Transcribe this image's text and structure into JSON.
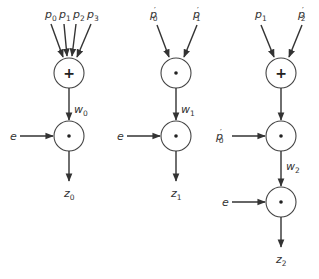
{
  "diagram": {
    "colors": {
      "stroke": "#333333",
      "background": "#ffffff"
    },
    "networks": [
      {
        "id": "net0",
        "inputs": [
          {
            "base": "p",
            "sub": "0",
            "prime": ""
          },
          {
            "base": "p",
            "sub": "1",
            "prime": ""
          },
          {
            "base": "p",
            "sub": "2",
            "prime": ""
          },
          {
            "base": "p",
            "sub": "3",
            "prime": ""
          }
        ],
        "nodes": [
          {
            "op": "+",
            "op_name": "sum"
          },
          {
            "op": "•",
            "op_name": "product",
            "side_input": {
              "base": "e",
              "sub": "",
              "prime": ""
            }
          }
        ],
        "intermediate": {
          "base": "w",
          "sub": "0"
        },
        "output": {
          "base": "z",
          "sub": "0"
        }
      },
      {
        "id": "net1",
        "inputs": [
          {
            "base": "p",
            "sub": "0",
            "prime": "′"
          },
          {
            "base": "p",
            "sub": "1",
            "prime": "′"
          }
        ],
        "nodes": [
          {
            "op": "•",
            "op_name": "product"
          },
          {
            "op": "•",
            "op_name": "product",
            "side_input": {
              "base": "e",
              "sub": "",
              "prime": ""
            }
          }
        ],
        "intermediate": {
          "base": "w",
          "sub": "1"
        },
        "output": {
          "base": "z",
          "sub": "1"
        }
      },
      {
        "id": "net2",
        "inputs": [
          {
            "base": "p",
            "sub": "1",
            "prime": ""
          },
          {
            "base": "p",
            "sub": "2",
            "prime": "′"
          }
        ],
        "nodes": [
          {
            "op": "+",
            "op_name": "sum"
          },
          {
            "op": "•",
            "op_name": "product",
            "side_input": {
              "base": "p",
              "sub": "0",
              "prime": "′"
            }
          },
          {
            "op": "•",
            "op_name": "product",
            "side_input": {
              "base": "e",
              "sub": "",
              "prime": ""
            }
          }
        ],
        "intermediate": {
          "base": "w",
          "sub": "2"
        },
        "output": {
          "base": "z",
          "sub": "2"
        }
      }
    ]
  }
}
